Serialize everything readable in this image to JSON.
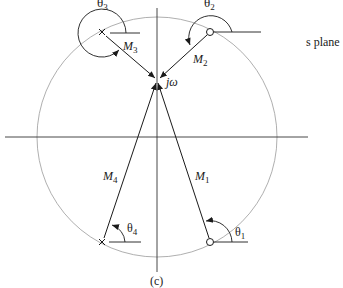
{
  "diagram": {
    "plane_label": "s plane",
    "caption": "(c)",
    "test_point_label": "jω",
    "colors": {
      "ink": "#1a1a1a",
      "circle": "#9a9a9a",
      "background": "#ffffff"
    },
    "poles": [
      {
        "id": "p3",
        "marker": "x",
        "magnitude_label": "M",
        "magnitude_sub": "3",
        "angle_label": "θ",
        "angle_sub": "3"
      },
      {
        "id": "p4",
        "marker": "x",
        "magnitude_label": "M",
        "magnitude_sub": "4",
        "angle_label": "θ",
        "angle_sub": "4"
      }
    ],
    "zeros": [
      {
        "id": "z2",
        "marker": "o",
        "magnitude_label": "M",
        "magnitude_sub": "2",
        "angle_label": "θ",
        "angle_sub": "2"
      },
      {
        "id": "z1",
        "marker": "o",
        "magnitude_label": "M",
        "magnitude_sub": "1",
        "angle_label": "θ",
        "angle_sub": "1"
      }
    ]
  }
}
